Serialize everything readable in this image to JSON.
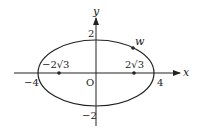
{
  "diagram": {
    "type": "ellipse-on-axes",
    "equation_hint": "x^2/16 + y^2/4 = 1",
    "axes": {
      "x_label": "x",
      "y_label": "y",
      "origin_label": "O"
    },
    "ticks": {
      "x_neg": "−4",
      "x_pos": "4",
      "y_pos": "2",
      "y_neg": "−2"
    },
    "foci": {
      "left_label": "−2√3",
      "right_label": "2√3"
    },
    "point": {
      "label": "w"
    },
    "colors": {
      "stroke": "#222222",
      "background": "#ffffff"
    }
  }
}
